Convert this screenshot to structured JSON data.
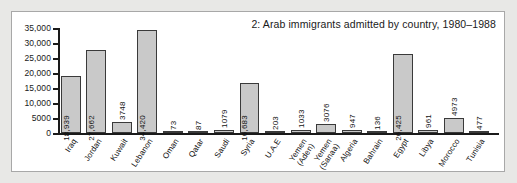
{
  "figure": {
    "title": "2: Arab immigrants admitted by country, 1980–1988",
    "panel_background": "#ffffff",
    "page_background": "#e8e8e6",
    "border_color": "#a8a8a8"
  },
  "chart_data": {
    "type": "bar",
    "title": "2: Arab immigrants admitted by country, 1980–1988",
    "xlabel": "",
    "ylabel": "",
    "ylim": [
      0,
      35000
    ],
    "grid": false,
    "legend": false,
    "bar_color": "#c9c9c9",
    "bar_edge_color": "#3a3a3a",
    "ytick_labels": [
      "0",
      "5000",
      "10,000",
      "15,000",
      "20,000",
      "25,000",
      "30,000",
      "35,000"
    ],
    "ytick_values": [
      0,
      5000,
      10000,
      15000,
      20000,
      25000,
      30000,
      35000
    ],
    "categories": [
      "Iraq",
      "Jordan",
      "Kuwait",
      "Lebanon",
      "Oman",
      "Qatar",
      "Saudi",
      "Syria",
      "U.A.E",
      "Yemen (Aden)",
      "Yemen (Sanaa)",
      "Algeria",
      "Bahrain",
      "Egypt",
      "Libya",
      "Morocco",
      "Tunisia"
    ],
    "category_labels_multiline": [
      [
        "Iraq"
      ],
      [
        "Jordan"
      ],
      [
        "Kuwait"
      ],
      [
        "Lebanon"
      ],
      [
        "Oman"
      ],
      [
        "Qatar"
      ],
      [
        "Saudi"
      ],
      [
        "Syria"
      ],
      [
        "U.A.E"
      ],
      [
        "Yemen",
        "(Aden)"
      ],
      [
        "Yemen",
        "(Sanaa)"
      ],
      [
        "Algeria"
      ],
      [
        "Bahrain"
      ],
      [
        "Egypt"
      ],
      [
        "Libya"
      ],
      [
        "Morocco"
      ],
      [
        "Tunisia"
      ]
    ],
    "values": [
      18939,
      27662,
      3748,
      34420,
      73,
      87,
      1079,
      16683,
      203,
      1033,
      3076,
      947,
      136,
      26425,
      961,
      4973,
      477
    ],
    "value_labels": [
      "18,939",
      "27,662",
      "3748",
      "34,420",
      "73",
      "87",
      "1079",
      "16,683",
      "203",
      "1033",
      "3076",
      "947",
      "136",
      "26,425",
      "961",
      "4973",
      "477"
    ]
  }
}
